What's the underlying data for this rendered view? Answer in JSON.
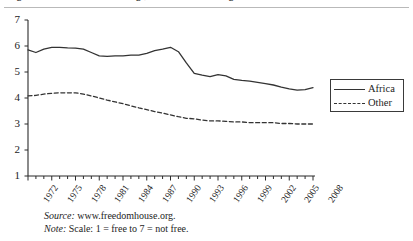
{
  "figure": {
    "title_cropped": "Figure 1. Freedom House ratings, Africa and other regions",
    "source_key": "Source:",
    "source_value": "www.freedomhouse.org.",
    "note_key": "Note:",
    "note_value": "Scale: 1 = free to 7 = not free."
  },
  "legend": {
    "position": "right",
    "items": [
      {
        "label": "Africa",
        "style": "solid"
      },
      {
        "label": "Other",
        "style": "dotted"
      }
    ]
  },
  "chart_data": {
    "type": "line",
    "title": "",
    "xlabel": "",
    "ylabel": "",
    "xlim": [
      1972,
      2008
    ],
    "ylim": [
      1,
      7
    ],
    "yticks": [
      1,
      2,
      3,
      4,
      5,
      6,
      7
    ],
    "xticks": [
      1972,
      1975,
      1978,
      1981,
      1984,
      1987,
      1990,
      1993,
      1996,
      1999,
      2002,
      2005,
      2008
    ],
    "xtick_labels": [
      "1972",
      "1975",
      "1978",
      "1981",
      "1984",
      "1987",
      "1990",
      "1993",
      "1996",
      "1999",
      "2002",
      "2005",
      "2008"
    ],
    "ytick_labels": [
      "1",
      "2",
      "3",
      "4",
      "5",
      "6",
      "7"
    ],
    "grid": false,
    "legend_position": "right",
    "x": [
      1972,
      1973,
      1974,
      1975,
      1976,
      1977,
      1978,
      1979,
      1980,
      1981,
      1982,
      1983,
      1984,
      1985,
      1986,
      1987,
      1988,
      1989,
      1990,
      1991,
      1992,
      1993,
      1994,
      1995,
      1996,
      1997,
      1998,
      1999,
      2000,
      2001,
      2002,
      2003,
      2004,
      2005,
      2006,
      2007,
      2008
    ],
    "series": [
      {
        "name": "Africa",
        "style": "solid",
        "color": "#333333",
        "values": [
          5.85,
          5.75,
          5.88,
          5.95,
          5.95,
          5.93,
          5.92,
          5.88,
          5.75,
          5.62,
          5.6,
          5.62,
          5.62,
          5.65,
          5.65,
          5.72,
          5.82,
          5.88,
          5.95,
          5.78,
          5.35,
          4.95,
          4.88,
          4.82,
          4.9,
          4.85,
          4.72,
          4.68,
          4.65,
          4.6,
          4.55,
          4.5,
          4.42,
          4.35,
          4.3,
          4.32,
          4.4
        ]
      },
      {
        "name": "Other",
        "style": "dotted",
        "color": "#333333",
        "values": [
          4.08,
          4.1,
          4.15,
          4.18,
          4.2,
          4.2,
          4.2,
          4.15,
          4.08,
          4.0,
          3.92,
          3.85,
          3.78,
          3.7,
          3.62,
          3.55,
          3.48,
          3.42,
          3.35,
          3.28,
          3.22,
          3.2,
          3.15,
          3.12,
          3.12,
          3.1,
          3.08,
          3.08,
          3.05,
          3.05,
          3.05,
          3.05,
          3.02,
          3.02,
          3.0,
          3.0,
          3.0
        ]
      }
    ]
  },
  "axis_geometry": {
    "plot_left": 28,
    "plot_right": 313,
    "plot_top": 20,
    "plot_bottom": 176
  }
}
